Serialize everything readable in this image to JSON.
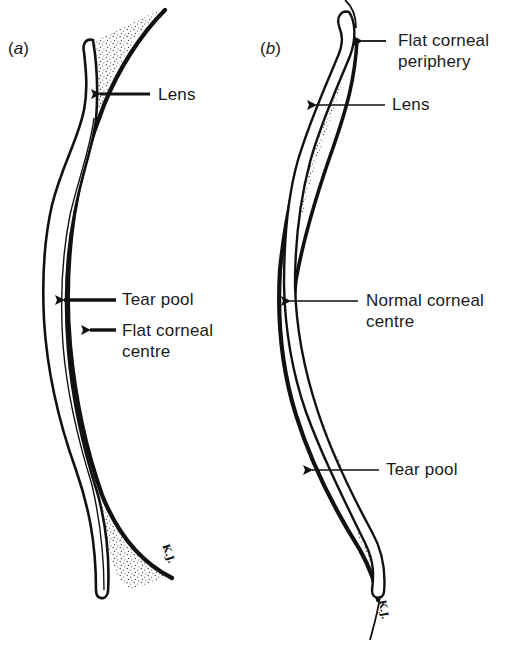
{
  "figure": {
    "panels": [
      {
        "id": "a",
        "label_open": "(",
        "label_letter": "a",
        "label_close": ")",
        "annotations": [
          {
            "text": "Lens"
          },
          {
            "text": "Tear pool"
          },
          {
            "text": "Flat corneal",
            "text2": "centre"
          }
        ],
        "signature": "K.J."
      },
      {
        "id": "b",
        "label_open": "(",
        "label_letter": "b",
        "label_close": ")",
        "annotations": [
          {
            "text": "Flat corneal",
            "text2": "periphery"
          },
          {
            "text": "Lens"
          },
          {
            "text": "Normal corneal",
            "text2": "centre"
          },
          {
            "text": "Tear pool"
          }
        ],
        "signature": "K.J."
      }
    ],
    "colors": {
      "ink": "#111111",
      "stipple": "#555555",
      "background": "#ffffff"
    }
  }
}
